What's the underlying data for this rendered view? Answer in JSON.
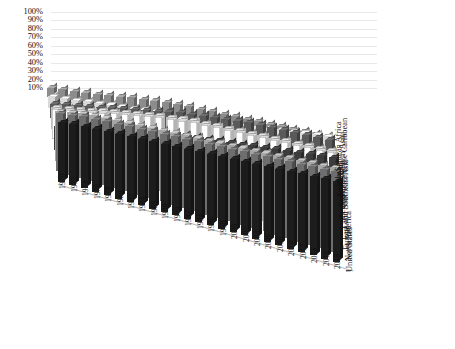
{
  "chart_data": {
    "type": "bar",
    "title": "",
    "subtitle": "",
    "xlabel": "",
    "ylabel": "",
    "zlabel": "",
    "projection": "3d-grouped-bar",
    "grid": true,
    "legend_position": "none",
    "ylim": [
      0,
      100
    ],
    "yticks": [
      "10%",
      "20%",
      "30%",
      "40%",
      "50%",
      "60%",
      "70%",
      "80%",
      "90%",
      "100%"
    ],
    "ytick_values": [
      10,
      20,
      30,
      40,
      50,
      60,
      70,
      80,
      90,
      100
    ],
    "categories": [
      "1970",
      "1972",
      "1974",
      "1976",
      "1978",
      "1980",
      "1982",
      "1984",
      "1986",
      "1988",
      "1990",
      "1992",
      "1994",
      "1996",
      "1998",
      "2000",
      "2002",
      "2004",
      "2006",
      "2008",
      "2010",
      "2012",
      "2014",
      "2016",
      "2018"
    ],
    "series": [
      {
        "name": "Sub-Saharan Africa",
        "color": "#8c8c8c",
        "values": [
          11,
          13,
          15,
          17,
          19,
          22,
          24,
          27,
          29,
          31,
          33,
          35,
          36,
          37,
          38,
          39,
          40,
          41,
          42,
          43,
          44,
          45,
          46,
          47,
          48
        ]
      },
      {
        "name": "South Asia",
        "color": "#d9d9d9",
        "values": [
          13,
          15,
          17,
          19,
          21,
          23,
          25,
          27,
          29,
          31,
          33,
          35,
          37,
          39,
          41,
          43,
          45,
          47,
          49,
          51,
          53,
          55,
          57,
          59,
          61
        ]
      },
      {
        "name": "Arab World",
        "color": "#5a5a5a",
        "values": [
          17,
          20,
          23,
          26,
          29,
          32,
          35,
          38,
          41,
          44,
          47,
          50,
          52,
          54,
          56,
          58,
          60,
          62,
          63,
          64,
          65,
          66,
          67,
          68,
          69
        ]
      },
      {
        "name": "Central and Western Asia",
        "color": "#bdbdbd",
        "values": [
          25,
          28,
          31,
          34,
          37,
          40,
          43,
          46,
          49,
          51,
          53,
          55,
          57,
          58,
          59,
          60,
          61,
          62,
          63,
          64,
          65,
          66,
          67,
          68,
          69
        ]
      },
      {
        "name": "Latin America and the Caribbean",
        "color": "#ffffff",
        "values": [
          35,
          38,
          41,
          44,
          47,
          50,
          53,
          56,
          59,
          61,
          63,
          65,
          67,
          68,
          69,
          70,
          71,
          72,
          73,
          74,
          75,
          76,
          77,
          78,
          79
        ]
      },
      {
        "name": "East and Southeast Asia",
        "color": "#3c3c3c",
        "values": [
          28,
          31,
          34,
          37,
          40,
          43,
          46,
          49,
          52,
          55,
          58,
          60,
          62,
          64,
          66,
          68,
          70,
          72,
          74,
          76,
          78,
          80,
          82,
          84,
          86
        ]
      },
      {
        "name": "Europe",
        "color": "#a5a5a5",
        "values": [
          58,
          61,
          63,
          65,
          66,
          67,
          68,
          69,
          70,
          71,
          72,
          73,
          74,
          75,
          76,
          77,
          78,
          79,
          80,
          81,
          82,
          83,
          84,
          85,
          86
        ]
      },
      {
        "name": "North America",
        "color": "#6e6e6e",
        "values": [
          68,
          70,
          72,
          73,
          74,
          75,
          76,
          77,
          78,
          79,
          80,
          81,
          82,
          83,
          84,
          85,
          86,
          87,
          88,
          89,
          90,
          91,
          92,
          93,
          94
        ]
      },
      {
        "name": "United States",
        "color": "#1c1c1c",
        "values": [
          70,
          72,
          73,
          74,
          75,
          76,
          77,
          78,
          79,
          80,
          81,
          82,
          83,
          84,
          85,
          86,
          87,
          88,
          89,
          90,
          91,
          92,
          93,
          94,
          95
        ]
      }
    ]
  }
}
